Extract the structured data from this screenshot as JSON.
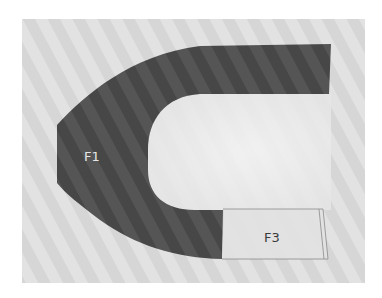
{
  "figure": {
    "colors": {
      "page_background": "#ffffff",
      "photo_background": "#d6d6d6",
      "stripe_light": "#e4e4e4",
      "stripe_dark": "#c9c9c9",
      "inner_light": "#efefef",
      "region_f1_fill": "#4d4d4d",
      "region_f3_fill": "#e2e2e2",
      "region_f3_outline": "#8a8a8a",
      "label_f1_color": "#e6e6e6",
      "label_f3_color": "#3a3a3a"
    },
    "regions": [
      {
        "id": "F1",
        "label": "F1",
        "shape": "U-shaped band opening to the right"
      },
      {
        "id": "F3",
        "label": "F3",
        "shape": "rectangle at end of lower arm"
      }
    ]
  }
}
